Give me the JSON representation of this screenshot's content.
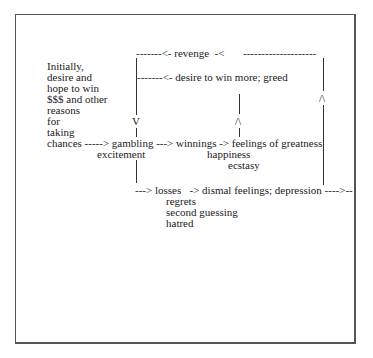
{
  "diagram": {
    "left_column": [
      "Initially,",
      "desire and",
      "hope to win",
      "$$$ and other",
      "reasons",
      "for",
      "taking"
    ],
    "top_line": {
      "left": "-------<- revenge  -<",
      "right": "--------------------"
    },
    "greed_line": "-------<- desire to win more; greed",
    "main_line": "chances -----> gambling ---> winnings -> feelings of greatness",
    "gambling_sub": "excitement",
    "winnings_sub": [
      "happiness",
      "ecstasy"
    ],
    "losses_line": "---> losses   -> dismal feelings; depression ---->--",
    "losses_sub": [
      "regrets",
      "second guessing",
      "hatred"
    ],
    "arrows": {
      "down": "V",
      "up": "/\\"
    }
  }
}
